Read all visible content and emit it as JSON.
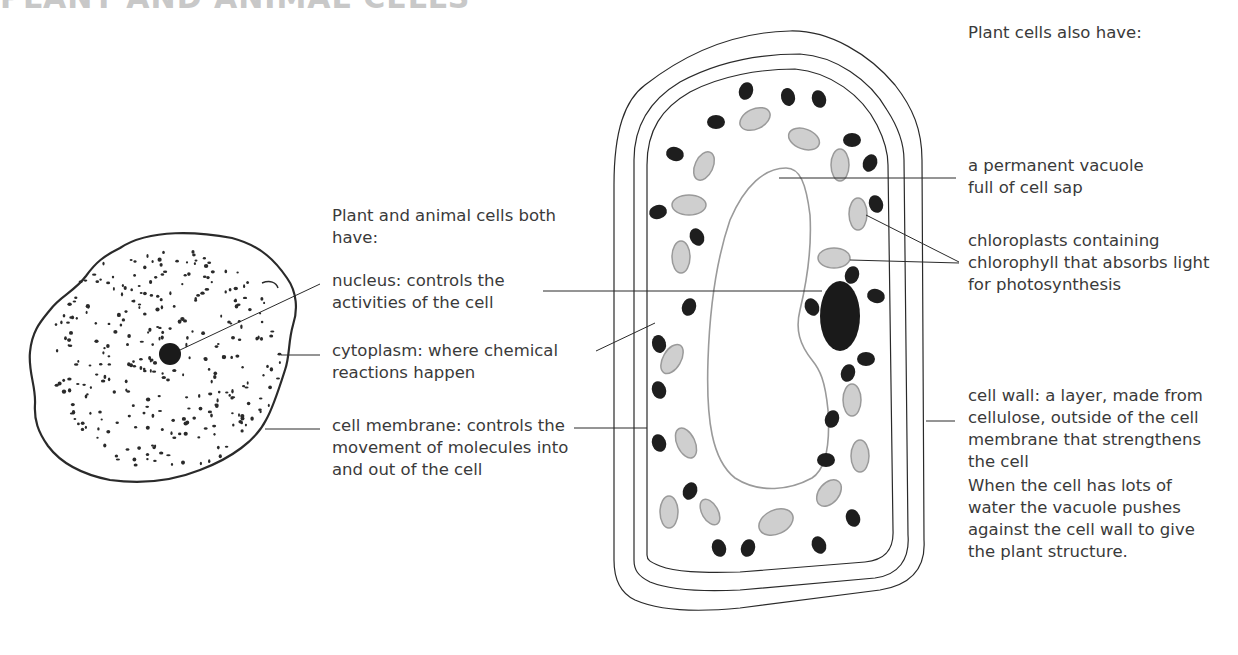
{
  "title": "PLANT AND ANIMAL CELLS",
  "shared_heading": "Plant and animal cells both have:",
  "shared_labels": [
    {
      "id": "nucleus",
      "text": "nucleus: controls the activities of the cell"
    },
    {
      "id": "cytoplasm",
      "text": "cytoplasm: where chemical reactions happen"
    },
    {
      "id": "cell-membrane",
      "text": "cell membrane: controls the movement of molecules into and out of the cell"
    }
  ],
  "plant_heading": "Plant cells also have:",
  "plant_labels": [
    {
      "id": "vacuole",
      "text": "a permanent vacuole full of cell sap"
    },
    {
      "id": "chloroplasts",
      "text": "chloroplasts containing chlorophyll that absorbs light for photosynthesis"
    },
    {
      "id": "cell-wall",
      "text": "cell wall: a layer, made from cellulose, outside of the cell membrane that strengthens the cell"
    }
  ],
  "note": "When the cell has lots of water the vacuole pushes against the cell wall to give the plant structure.",
  "colors": {
    "outline": "#2a2a2a",
    "nucleus": "#1a1a1a",
    "mitochondria": "#1e1e1e",
    "chloroplast_fill": "#cfcfcf",
    "chloroplast_stroke": "#9a9a9a",
    "vacuole_stroke": "#9a9a9a",
    "title": "#c8c8c8",
    "text": "#3a3a3a"
  }
}
